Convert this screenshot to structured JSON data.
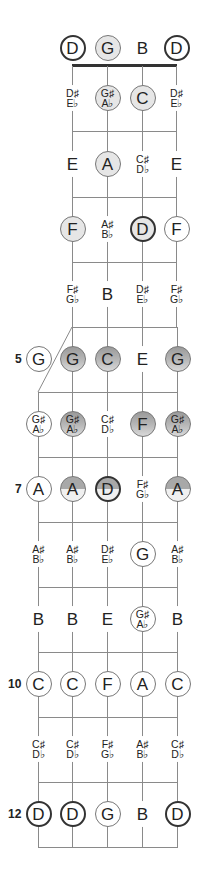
{
  "diagram": {
    "title": "",
    "upper_strings_x": [
      72,
      107,
      142,
      176
    ],
    "lower_strings_x": [
      38,
      72,
      107,
      142,
      177
    ],
    "row_y": [
      48,
      98,
      164,
      229,
      294,
      359,
      424,
      489,
      554,
      619,
      684,
      749,
      814
    ],
    "fret_numbers": [
      {
        "label": "5",
        "row": 5
      },
      {
        "label": "7",
        "row": 7
      },
      {
        "label": "10",
        "row": 10
      },
      {
        "label": "12",
        "row": 12
      }
    ],
    "colors": {
      "line": "#8a8a8a",
      "nut": "#333333",
      "light_fill": "#e6e6e6",
      "gray_fill": "#a8a8a8",
      "text": "#222222"
    },
    "notes": [
      {
        "row": 0,
        "col": 0,
        "section": "upper",
        "label": "D",
        "style": "thick-white"
      },
      {
        "row": 0,
        "col": 1,
        "section": "upper",
        "label": "G",
        "style": "thin-light"
      },
      {
        "row": 0,
        "col": 2,
        "section": "upper",
        "label": "B",
        "style": "plain"
      },
      {
        "row": 0,
        "col": 3,
        "section": "upper",
        "label": "D",
        "style": "thick-white"
      },
      {
        "row": 1,
        "col": 0,
        "section": "upper",
        "label": "D♯/E♭",
        "style": "plain"
      },
      {
        "row": 1,
        "col": 1,
        "section": "upper",
        "label": "G♯/A♭",
        "style": "thin-light"
      },
      {
        "row": 1,
        "col": 2,
        "section": "upper",
        "label": "C",
        "style": "thin-light"
      },
      {
        "row": 1,
        "col": 3,
        "section": "upper",
        "label": "D♯/E♭",
        "style": "plain"
      },
      {
        "row": 2,
        "col": 0,
        "section": "upper",
        "label": "E",
        "style": "plain"
      },
      {
        "row": 2,
        "col": 1,
        "section": "upper",
        "label": "A",
        "style": "thin-light"
      },
      {
        "row": 2,
        "col": 2,
        "section": "upper",
        "label": "C♯/D♭",
        "style": "plain"
      },
      {
        "row": 2,
        "col": 3,
        "section": "upper",
        "label": "E",
        "style": "plain"
      },
      {
        "row": 3,
        "col": 0,
        "section": "upper",
        "label": "F",
        "style": "thin-light"
      },
      {
        "row": 3,
        "col": 1,
        "section": "upper",
        "label": "A♯/B♭",
        "style": "plain"
      },
      {
        "row": 3,
        "col": 2,
        "section": "upper",
        "label": "D",
        "style": "thick-light"
      },
      {
        "row": 3,
        "col": 3,
        "section": "upper",
        "label": "F",
        "style": "thin-white"
      },
      {
        "row": 4,
        "col": 0,
        "section": "upper",
        "label": "F♯/G♭",
        "style": "plain"
      },
      {
        "row": 4,
        "col": 1,
        "section": "upper",
        "label": "B",
        "style": "plain"
      },
      {
        "row": 4,
        "col": 2,
        "section": "upper",
        "label": "D♯/E♭",
        "style": "plain"
      },
      {
        "row": 4,
        "col": 3,
        "section": "upper",
        "label": "F♯/G♭",
        "style": "plain"
      },
      {
        "row": 5,
        "col": 0,
        "section": "lower",
        "label": "G",
        "style": "thin-white"
      },
      {
        "row": 5,
        "col": 1,
        "section": "lower",
        "label": "G",
        "style": "thin-gray"
      },
      {
        "row": 5,
        "col": 2,
        "section": "lower",
        "label": "C",
        "style": "thin-gray"
      },
      {
        "row": 5,
        "col": 3,
        "section": "lower",
        "label": "E",
        "style": "plain"
      },
      {
        "row": 5,
        "col": 4,
        "section": "lower",
        "label": "G",
        "style": "thin-gray"
      },
      {
        "row": 6,
        "col": 0,
        "section": "lower",
        "label": "G♯/A♭",
        "style": "thin-white"
      },
      {
        "row": 6,
        "col": 1,
        "section": "lower",
        "label": "G♯/A♭",
        "style": "thin-gray"
      },
      {
        "row": 6,
        "col": 2,
        "section": "lower",
        "label": "C♯/D♭",
        "style": "plain"
      },
      {
        "row": 6,
        "col": 3,
        "section": "lower",
        "label": "F",
        "style": "thin-gray"
      },
      {
        "row": 6,
        "col": 4,
        "section": "lower",
        "label": "G♯/A♭",
        "style": "thin-gray"
      },
      {
        "row": 7,
        "col": 0,
        "section": "lower",
        "label": "A",
        "style": "thin-white"
      },
      {
        "row": 7,
        "col": 1,
        "section": "lower",
        "label": "A",
        "style": "thin-half"
      },
      {
        "row": 7,
        "col": 2,
        "section": "lower",
        "label": "D",
        "style": "thick-half"
      },
      {
        "row": 7,
        "col": 3,
        "section": "lower",
        "label": "F♯/G♭",
        "style": "plain"
      },
      {
        "row": 7,
        "col": 4,
        "section": "lower",
        "label": "A",
        "style": "thin-half"
      },
      {
        "row": 8,
        "col": 0,
        "section": "lower",
        "label": "A♯/B♭",
        "style": "plain"
      },
      {
        "row": 8,
        "col": 1,
        "section": "lower",
        "label": "A♯/B♭",
        "style": "plain"
      },
      {
        "row": 8,
        "col": 2,
        "section": "lower",
        "label": "D♯/E♭",
        "style": "plain"
      },
      {
        "row": 8,
        "col": 3,
        "section": "lower",
        "label": "G",
        "style": "thin-white"
      },
      {
        "row": 8,
        "col": 4,
        "section": "lower",
        "label": "A♯/B♭",
        "style": "plain"
      },
      {
        "row": 9,
        "col": 0,
        "section": "lower",
        "label": "B",
        "style": "plain"
      },
      {
        "row": 9,
        "col": 1,
        "section": "lower",
        "label": "B",
        "style": "plain"
      },
      {
        "row": 9,
        "col": 2,
        "section": "lower",
        "label": "E",
        "style": "plain"
      },
      {
        "row": 9,
        "col": 3,
        "section": "lower",
        "label": "G♯/A♭",
        "style": "thin-white"
      },
      {
        "row": 9,
        "col": 4,
        "section": "lower",
        "label": "B",
        "style": "plain"
      },
      {
        "row": 10,
        "col": 0,
        "section": "lower",
        "label": "C",
        "style": "thin-white"
      },
      {
        "row": 10,
        "col": 1,
        "section": "lower",
        "label": "C",
        "style": "thin-white"
      },
      {
        "row": 10,
        "col": 2,
        "section": "lower",
        "label": "F",
        "style": "thin-white"
      },
      {
        "row": 10,
        "col": 3,
        "section": "lower",
        "label": "A",
        "style": "thin-white"
      },
      {
        "row": 10,
        "col": 4,
        "section": "lower",
        "label": "C",
        "style": "thin-white"
      },
      {
        "row": 11,
        "col": 0,
        "section": "lower",
        "label": "C♯/D♭",
        "style": "plain"
      },
      {
        "row": 11,
        "col": 1,
        "section": "lower",
        "label": "C♯/D♭",
        "style": "plain"
      },
      {
        "row": 11,
        "col": 2,
        "section": "lower",
        "label": "F♯/G♭",
        "style": "plain"
      },
      {
        "row": 11,
        "col": 3,
        "section": "lower",
        "label": "A♯/B♭",
        "style": "plain"
      },
      {
        "row": 11,
        "col": 4,
        "section": "lower",
        "label": "C♯/D♭",
        "style": "plain"
      },
      {
        "row": 12,
        "col": 0,
        "section": "lower",
        "label": "D",
        "style": "thick-white"
      },
      {
        "row": 12,
        "col": 1,
        "section": "lower",
        "label": "D",
        "style": "thick-white"
      },
      {
        "row": 12,
        "col": 2,
        "section": "lower",
        "label": "G",
        "style": "thin-white"
      },
      {
        "row": 12,
        "col": 3,
        "section": "lower",
        "label": "B",
        "style": "plain"
      },
      {
        "row": 12,
        "col": 4,
        "section": "lower",
        "label": "D",
        "style": "thick-white"
      }
    ]
  }
}
